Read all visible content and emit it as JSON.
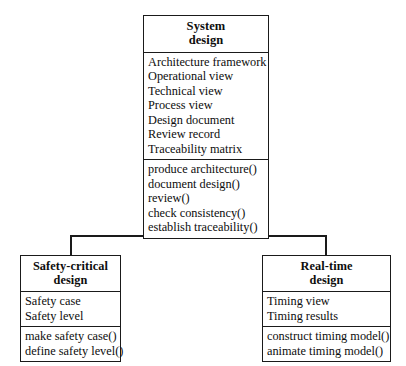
{
  "diagram": {
    "type": "uml-class-diagram",
    "relationship": "generalization",
    "relationship_marker": "hollow-triangle",
    "background_color": "#ffffff",
    "line_color": "#1a1a1a",
    "classes": {
      "parent": {
        "name_lines": [
          "System",
          "design"
        ],
        "attributes": [
          "Architecture framework",
          "Operational view",
          "Technical view",
          "Process view",
          "Design document",
          "Review record",
          "Traceability matrix"
        ],
        "operations": [
          "produce architecture()",
          "document design()",
          "review()",
          "check consistency()",
          "establish traceability()"
        ]
      },
      "child_left": {
        "name_lines": [
          "Safety-critical",
          "design"
        ],
        "attributes": [
          "Safety case",
          "Safety level"
        ],
        "operations": [
          "make safety case()",
          "define safety level()"
        ]
      },
      "child_right": {
        "name_lines": [
          "Real-time",
          "design"
        ],
        "attributes": [
          "Timing view",
          "Timing results"
        ],
        "operations": [
          "construct timing model()",
          "animate timing model()"
        ]
      }
    }
  }
}
